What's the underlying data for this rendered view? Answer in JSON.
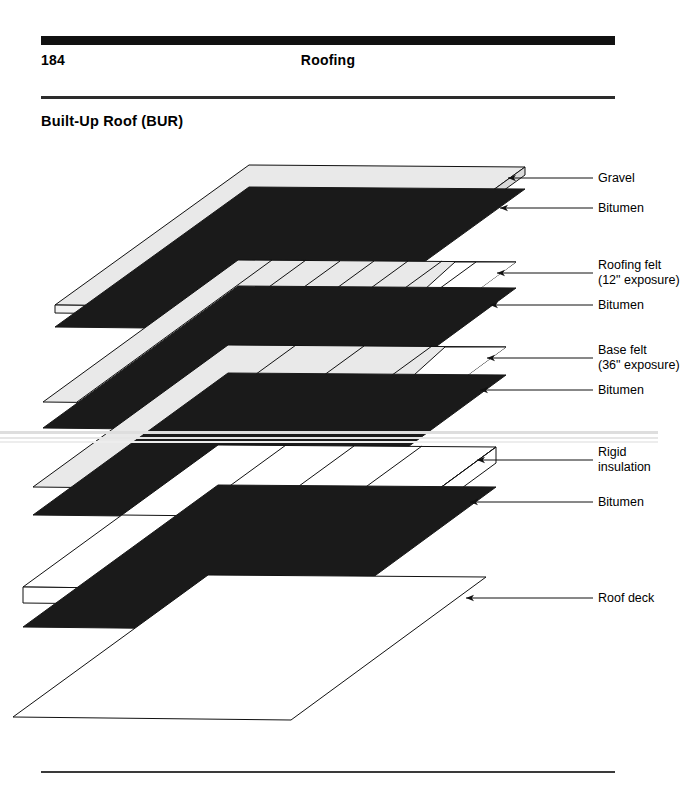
{
  "header": {
    "folio": "184",
    "running_head": "Roofing"
  },
  "section": {
    "title": "Built-Up Roof (BUR)"
  },
  "diagram": {
    "type": "exploded-isometric-assembly",
    "layers": [
      {
        "id": "gravel",
        "label": "Gravel",
        "fill": "#e9e9e9",
        "kind": "slab-thin"
      },
      {
        "id": "bitumen-1",
        "label": "Bitumen",
        "fill": "#1a1a1a",
        "kind": "sheet"
      },
      {
        "id": "roofing-felt",
        "label": "Roofing felt",
        "sublabel": "(12\" exposure)",
        "fill": "#e9e9e9",
        "kind": "stripped-sheet",
        "strips": 8
      },
      {
        "id": "bitumen-2",
        "label": "Bitumen",
        "fill": "#1a1a1a",
        "kind": "sheet"
      },
      {
        "id": "base-felt",
        "label": "Base felt",
        "sublabel": "(36\" exposure)",
        "fill": "#e9e9e9",
        "kind": "stripped-sheet",
        "strips": 4
      },
      {
        "id": "bitumen-3",
        "label": "Bitumen",
        "fill": "#1a1a1a",
        "kind": "sheet"
      },
      {
        "id": "insulation",
        "label": "Rigid",
        "sublabel": "insulation",
        "fill": "#ffffff",
        "kind": "board-slab",
        "boards": 4
      },
      {
        "id": "bitumen-4",
        "label": "Bitumen",
        "fill": "#1a1a1a",
        "kind": "sheet"
      },
      {
        "id": "roof-deck",
        "label": "Roof deck",
        "fill": "#ffffff",
        "kind": "outline-sheet"
      }
    ],
    "callouts": [
      {
        "id": "gravel",
        "line1": "Gravel",
        "line2": ""
      },
      {
        "id": "bitumen-1",
        "line1": "Bitumen",
        "line2": ""
      },
      {
        "id": "roofing-felt",
        "line1": "Roofing felt",
        "line2": "(12\" exposure)"
      },
      {
        "id": "bitumen-2",
        "line1": "Bitumen",
        "line2": ""
      },
      {
        "id": "base-felt",
        "line1": "Base felt",
        "line2": "(36\" exposure)"
      },
      {
        "id": "bitumen-3",
        "line1": "Bitumen",
        "line2": ""
      },
      {
        "id": "insulation",
        "line1": "Rigid",
        "line2": "insulation"
      },
      {
        "id": "bitumen-4",
        "line1": "Bitumen",
        "line2": ""
      },
      {
        "id": "roof-deck",
        "line1": "Roof deck",
        "line2": ""
      }
    ],
    "colors": {
      "sheet_light": "#e9e9e9",
      "bitumen_dark": "#1a1a1a",
      "outline": "#111111",
      "page_background": "#ffffff"
    }
  }
}
